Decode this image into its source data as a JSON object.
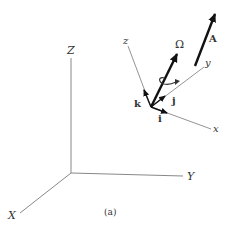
{
  "figure": {
    "caption": "(a)",
    "inertial_frame": {
      "axes": [
        {
          "name": "X",
          "label": "X"
        },
        {
          "name": "Y",
          "label": "Y"
        },
        {
          "name": "Z",
          "label": "Z"
        }
      ]
    },
    "moving_frame": {
      "axes": [
        {
          "name": "x",
          "label": "x"
        },
        {
          "name": "y",
          "label": "y"
        },
        {
          "name": "z",
          "label": "z"
        }
      ],
      "unit_vectors": [
        {
          "name": "i",
          "label": "i"
        },
        {
          "name": "j",
          "label": "j"
        },
        {
          "name": "k",
          "label": "k"
        }
      ]
    },
    "vectors": [
      {
        "name": "angular-velocity",
        "label": "Ω"
      },
      {
        "name": "vector-A",
        "label": "A"
      }
    ],
    "colors": {
      "axis": "#888888",
      "vector": "#111111",
      "label": "#333333"
    }
  }
}
